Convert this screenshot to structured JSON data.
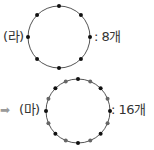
{
  "figures": [
    {
      "label": "(라)",
      "count_text": ": 8개",
      "dot_count": 8,
      "has_arrow": false,
      "center": [
        59,
        37
      ],
      "radius": 31,
      "dots": [
        {
          "angle": 0,
          "color": "#111111"
        },
        {
          "angle": 45,
          "color": "#111111"
        },
        {
          "angle": 90,
          "color": "#111111"
        },
        {
          "angle": 135,
          "color": "#111111"
        },
        {
          "angle": 180,
          "color": "#111111"
        },
        {
          "angle": 225,
          "color": "#111111"
        },
        {
          "angle": 270,
          "color": "#111111"
        },
        {
          "angle": 315,
          "color": "#111111"
        }
      ]
    },
    {
      "label": "(마)",
      "count_text": ": 16개",
      "dot_count": 16,
      "has_arrow": true,
      "arrow": "➡",
      "center": [
        78,
        111
      ],
      "radius": 32,
      "dots": [
        {
          "angle": 0,
          "color": "#111111"
        },
        {
          "angle": 22.5,
          "color": "#666666"
        },
        {
          "angle": 45,
          "color": "#111111"
        },
        {
          "angle": 67.5,
          "color": "#666666"
        },
        {
          "angle": 90,
          "color": "#111111"
        },
        {
          "angle": 112.5,
          "color": "#666666"
        },
        {
          "angle": 135,
          "color": "#111111"
        },
        {
          "angle": 157.5,
          "color": "#666666"
        },
        {
          "angle": 180,
          "color": "#111111"
        },
        {
          "angle": 202.5,
          "color": "#666666"
        },
        {
          "angle": 225,
          "color": "#111111"
        },
        {
          "angle": 247.5,
          "color": "#666666"
        },
        {
          "angle": 270,
          "color": "#111111"
        },
        {
          "angle": 292.5,
          "color": "#666666"
        },
        {
          "angle": 315,
          "color": "#111111"
        },
        {
          "angle": 337.5,
          "color": "#666666"
        }
      ]
    }
  ],
  "colors": {
    "circle_stroke": "#555555",
    "text": "#333333",
    "arrow": "#9a9a9a"
  }
}
